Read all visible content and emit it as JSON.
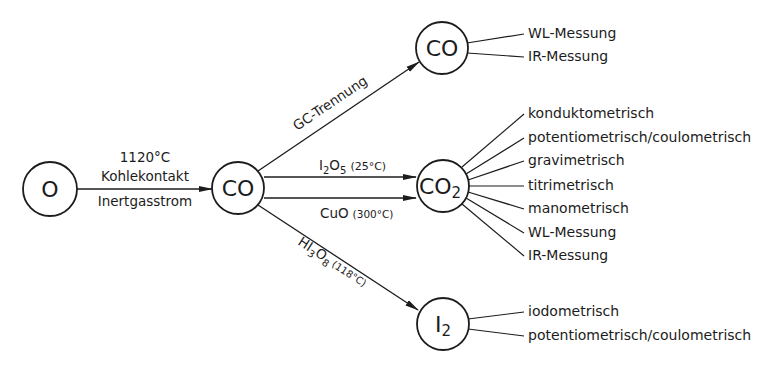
{
  "nodes": {
    "o": {
      "label": "O"
    },
    "co_mid": {
      "label": "CO"
    },
    "co_top": {
      "label": "CO"
    },
    "co2": {
      "label": "CO",
      "sub": "2"
    },
    "i2": {
      "label": "I",
      "sub": "2"
    }
  },
  "edges": {
    "o_to_co": {
      "line1": "1120°C",
      "line2": "Kohlekontakt",
      "line3": "Inertgasstrom"
    },
    "co_to_co_top": {
      "label": "GC-Trennung"
    },
    "co_to_co2_i2o5": {
      "formula_main": "I",
      "formula_sub1": "2",
      "formula_mid": "O",
      "formula_sub2": "5",
      "condition": "(25°C)"
    },
    "co_to_co2_cuo": {
      "formula": "CuO",
      "condition": "(300°C)"
    },
    "co_to_i2": {
      "formula_main": "HI",
      "formula_sub1": "3",
      "formula_mid": "O",
      "formula_sub2": "8",
      "condition": "(118°C)"
    }
  },
  "methods": {
    "co_top": [
      "WL-Messung",
      "IR-Messung"
    ],
    "co2": [
      "konduktometrisch",
      "potentiometrisch/coulometrisch",
      "gravimetrisch",
      "titrimetrisch",
      "manometrisch",
      "WL-Messung",
      "IR-Messung"
    ],
    "i2": [
      "iodometrisch",
      "potentiometrisch/coulometrisch"
    ]
  }
}
